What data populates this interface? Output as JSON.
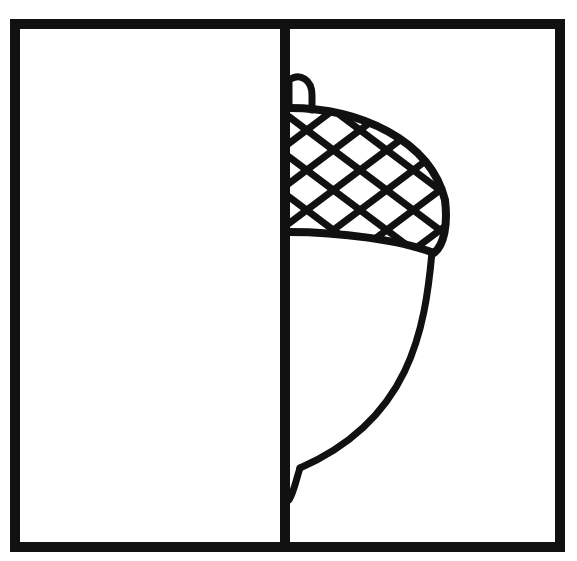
{
  "worksheet": {
    "title": "Symmetry drawing worksheet - complete the acorn",
    "subject": "acorn",
    "drawn_half": "right",
    "empty_half": "left"
  },
  "colors": {
    "background": "#ffffff",
    "ink": "#111111"
  }
}
